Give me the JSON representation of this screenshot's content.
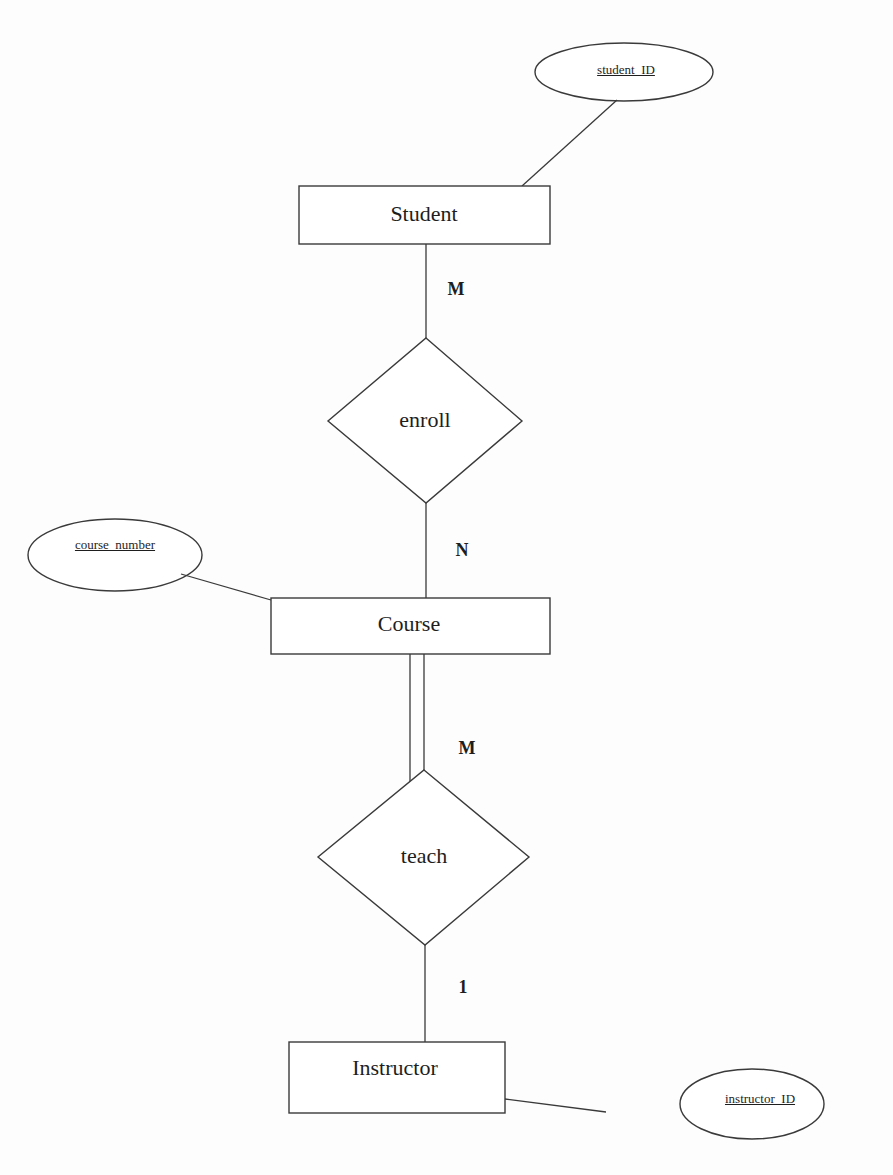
{
  "diagram": {
    "type": "ER diagram",
    "entities": [
      {
        "name": "Student",
        "key_attribute": "student_ID"
      },
      {
        "name": "Course",
        "key_attribute": "course_number"
      },
      {
        "name": "Instructor",
        "key_attribute": "instructor_ID"
      }
    ],
    "relationships": [
      {
        "name": "enroll",
        "from": "Student",
        "to": "Course",
        "cardinality_from": "M",
        "cardinality_to": "N"
      },
      {
        "name": "teach",
        "from": "Course",
        "to": "Instructor",
        "cardinality_from": "M",
        "cardinality_to": "1",
        "total_participation": "Course"
      }
    ],
    "labels": {
      "student": "Student",
      "course": "Course",
      "instructor": "Instructor",
      "enroll": "enroll",
      "teach": "teach",
      "student_id": "student_ID",
      "course_number": "course_number",
      "instructor_id": "instructor_ID",
      "card_student_enroll": "M",
      "card_enroll_course": "N",
      "card_course_teach": "M",
      "card_teach_instructor": "1"
    },
    "colors": {
      "stroke": "#3a3a3a",
      "text": "#1e1e1e",
      "background": "#fdfdfd"
    }
  }
}
